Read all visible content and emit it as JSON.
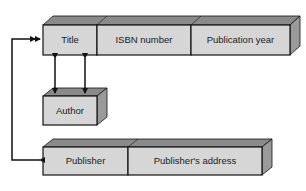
{
  "diagram": {
    "type": "record-structure",
    "colors": {
      "front": "#d6d6d6",
      "top": "#8a8a8a",
      "side": "#9a9a9a",
      "stroke": "#111111",
      "arrow": "#111111"
    },
    "records": [
      {
        "id": "book",
        "fields": [
          {
            "label": "Title"
          },
          {
            "label": "ISBN number"
          },
          {
            "label": "Publication year"
          }
        ]
      },
      {
        "id": "author",
        "fields": [
          {
            "label": "Author"
          }
        ]
      },
      {
        "id": "publisher",
        "fields": [
          {
            "label": "Publisher"
          },
          {
            "label": "Publisher's address"
          }
        ]
      }
    ],
    "links": [
      {
        "from": "Title",
        "to": "Author",
        "kind": "bidirectional"
      },
      {
        "from": "Title",
        "to": "Author",
        "kind": "bidirectional"
      },
      {
        "from": "Publisher",
        "to": "Title",
        "kind": "bidirectional-elbow"
      }
    ]
  }
}
